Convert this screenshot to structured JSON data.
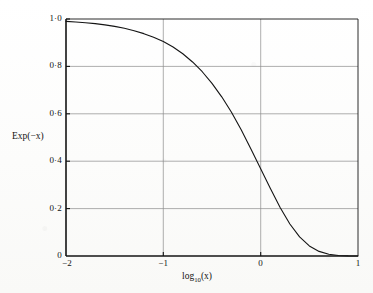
{
  "figure": {
    "background_color": "#fdfdfc",
    "ink_color": "#141414",
    "grid_color": "#8d8d8d"
  },
  "axes": {
    "y_title": "Exp(−x)",
    "x_title_base": "log",
    "x_title_sub": "10",
    "x_title_arg": "(x)"
  },
  "ticks": {
    "y": [
      {
        "value": 1.0,
        "label": "1·0"
      },
      {
        "value": 0.8,
        "label": "0·8"
      },
      {
        "value": 0.6,
        "label": "0·6"
      },
      {
        "value": 0.4,
        "label": "0·4"
      },
      {
        "value": 0.2,
        "label": "0·2"
      },
      {
        "value": 0.0,
        "label": "0"
      }
    ],
    "x": [
      {
        "value": -2,
        "label": "−2"
      },
      {
        "value": -1,
        "label": "−1"
      },
      {
        "value": 0,
        "label": "0"
      },
      {
        "value": 1,
        "label": "1"
      }
    ]
  },
  "chart_data": {
    "type": "line",
    "title": "",
    "subtitle": "",
    "xlabel": "log10(x)",
    "ylabel": "Exp(-x)",
    "xlim": [
      -2,
      1
    ],
    "ylim": [
      0,
      1
    ],
    "grid": true,
    "legend_position": "none",
    "xticks": [
      -2,
      -1,
      0,
      1
    ],
    "yticks": [
      0,
      0.2,
      0.4,
      0.6,
      0.8,
      1.0
    ],
    "xtick_labels": [
      "−2",
      "−1",
      "0",
      "1"
    ],
    "ytick_labels": [
      "0",
      "0·2",
      "0·4",
      "0·6",
      "0·8",
      "1·0"
    ],
    "series": [
      {
        "name": "Exp(-x)",
        "color": "#141414",
        "line_width": 1.1,
        "x": [
          -2.0,
          -1.9,
          -1.8,
          -1.7,
          -1.6,
          -1.5,
          -1.4,
          -1.3,
          -1.2,
          -1.1,
          -1.0,
          -0.9,
          -0.8,
          -0.7,
          -0.6,
          -0.5,
          -0.4,
          -0.3,
          -0.2,
          -0.1,
          0.0,
          0.1,
          0.2,
          0.3,
          0.4,
          0.5,
          0.6,
          0.7,
          0.8,
          0.9,
          1.0
        ],
        "values": [
          0.99,
          0.9874,
          0.9843,
          0.9803,
          0.9753,
          0.9689,
          0.9609,
          0.9508,
          0.9382,
          0.9226,
          0.9048,
          0.8817,
          0.8533,
          0.8187,
          0.7775,
          0.7285,
          0.6716,
          0.6063,
          0.5326,
          0.4516,
          0.3679,
          0.2847,
          0.2048,
          0.1349,
          0.0804,
          0.0424,
          0.0194,
          0.0071,
          0.0019,
          0.0004,
          5e-05
        ]
      }
    ],
    "annotations": []
  }
}
